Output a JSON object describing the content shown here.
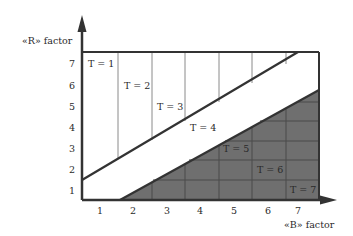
{
  "diagram": {
    "y_axis_label": "«R» factor",
    "x_axis_label": "«B» factor",
    "y_ticks": [
      "1",
      "2",
      "3",
      "4",
      "5",
      "6",
      "7"
    ],
    "x_ticks": [
      "1",
      "2",
      "3",
      "4",
      "5",
      "6",
      "7"
    ],
    "regions": [
      {
        "label": "T = 1"
      },
      {
        "label": "T = 2"
      },
      {
        "label": "T = 3"
      },
      {
        "label": "T = 4"
      },
      {
        "label": "T = 5"
      },
      {
        "label": "T = 6"
      },
      {
        "label": "T = 7"
      }
    ],
    "colors": {
      "axis": "#333333",
      "shaded_region": "#6f6f6f",
      "grid_line": "#4a4a4a",
      "light_grid_line": "#8a8a8a",
      "background": "#ffffff"
    }
  }
}
